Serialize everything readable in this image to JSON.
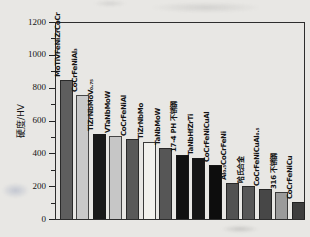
{
  "figure": {
    "background_color": "#e8e7e4",
    "axis_line_color": "#2d2d2d",
    "text_color": "#141414"
  },
  "chart_data": {
    "type": "bar",
    "title": "",
    "xlabel": "",
    "ylabel": "硬度/HV",
    "ylim": [
      0,
      1200
    ],
    "yticks": [
      "0",
      "200",
      "400",
      "600",
      "800",
      "1000",
      "1200"
    ],
    "minor_tick_step": 100,
    "grid": false,
    "legend": null,
    "categories": [
      "MoTiVFeNiZrCoCr",
      "CoCrFeNiAl₃",
      "TiZrNbMoV₀.₇₅",
      "VTaNbMoW",
      "CoCrFeNiAl",
      "TiZrNbMo",
      "TaNbMoW",
      "17-4 PH 不锈钢",
      "TaNbHfZrTi",
      "CoCrFeNiCuAl",
      "Al₀.₅CoCrFeNi",
      "哈氏合金",
      "CoCrFeNiCuAl₀.₅",
      "316 不锈钢",
      "CoCrFeNiCu"
    ],
    "values": [
      850,
      760,
      520,
      510,
      490,
      470,
      435,
      390,
      375,
      330,
      220,
      205,
      185,
      165,
      105
    ],
    "bar_colors": [
      "#5e5e5e",
      "#c9c9c9",
      "#1a1a1a",
      "#c6c6c6",
      "#595959",
      "#f2f1ed",
      "#565656",
      "#111111",
      "#151515",
      "#0d0d0d",
      "#525252",
      "#575757",
      "#474747",
      "#9b9b9b",
      "#3e3e3e"
    ]
  }
}
